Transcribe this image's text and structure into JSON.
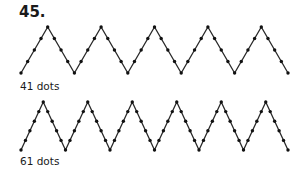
{
  "problem_number": "45.",
  "figures": [
    {
      "label": "41 dots",
      "dots": 41,
      "peaks": 5,
      "intervals_per_side": 4,
      "x0": 21,
      "x1": 288,
      "y_top": 27,
      "y_bottom": 73,
      "label_top": 80
    },
    {
      "label": "61 dots",
      "dots": 61,
      "peaks": 6,
      "intervals_per_side": 5,
      "x0": 21,
      "x1": 288,
      "y_top": 102,
      "y_bottom": 150,
      "label_top": 155
    }
  ],
  "colors": {
    "line": "#2a2a2a",
    "dot": "#111111"
  }
}
